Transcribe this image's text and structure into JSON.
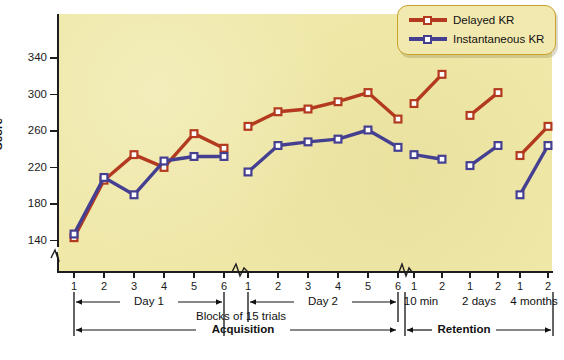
{
  "chart_data": {
    "type": "line",
    "title": "",
    "xlabel": "Blocks of 15 trials",
    "ylabel": "Score",
    "ylim": [
      120,
      352
    ],
    "yticks": [
      140,
      180,
      220,
      260,
      300,
      340
    ],
    "grid": false,
    "legend_position": "top-right",
    "x_tick_labels": [
      "1",
      "2",
      "3",
      "4",
      "5",
      "6",
      "1",
      "2",
      "3",
      "4",
      "5",
      "6",
      "1",
      "2",
      "1",
      "2",
      "1",
      "2"
    ],
    "x_group_labels": [
      "Day 1",
      "Day 2",
      "10 min",
      "2 days",
      "4 months"
    ],
    "phase_labels": [
      "Acquisition",
      "Retention"
    ],
    "series": [
      {
        "name": "Delayed KR",
        "color": "#b33a1e",
        "marker": "open-square",
        "segments": [
          {
            "group": "Day 1",
            "x": [
              "1",
              "2",
              "3",
              "4",
              "5",
              "6"
            ],
            "values": [
              142,
              205,
              233,
              219,
              256,
              240
            ]
          },
          {
            "group": "Day 2",
            "x": [
              "1",
              "2",
              "3",
              "4",
              "5",
              "6"
            ],
            "values": [
              264,
              280,
              283,
              291,
              301,
              272
            ]
          },
          {
            "group": "10 min",
            "x": [
              "1",
              "2"
            ],
            "values": [
              289,
              321
            ]
          },
          {
            "group": "2 days",
            "x": [
              "1",
              "2"
            ],
            "values": [
              276,
              301
            ]
          },
          {
            "group": "4 months",
            "x": [
              "1",
              "2"
            ],
            "values": [
              232,
              264
            ]
          }
        ]
      },
      {
        "name": "Instantaneous KR",
        "color": "#453f91",
        "marker": "open-square",
        "segments": [
          {
            "group": "Day 1",
            "x": [
              "1",
              "2",
              "3",
              "4",
              "5",
              "6"
            ],
            "values": [
              146,
              208,
              189,
              226,
              231,
              231
            ]
          },
          {
            "group": "Day 2",
            "x": [
              "1",
              "2",
              "3",
              "4",
              "5",
              "6"
            ],
            "values": [
              214,
              243,
              247,
              250,
              260,
              241
            ]
          },
          {
            "group": "10 min",
            "x": [
              "1",
              "2"
            ],
            "values": [
              233,
              228
            ]
          },
          {
            "group": "2 days",
            "x": [
              "1",
              "2"
            ],
            "values": [
              221,
              243
            ]
          },
          {
            "group": "4 months",
            "x": [
              "1",
              "2"
            ],
            "values": [
              189,
              243
            ]
          }
        ]
      }
    ]
  },
  "axis": {
    "y_title": "Score",
    "y_tick_labels": [
      "340",
      "300",
      "260",
      "220",
      "180",
      "140"
    ],
    "x_caption": "Blocks of 15 trials"
  },
  "legend": {
    "items": [
      {
        "label": "Delayed KR",
        "color": "#b33a1e"
      },
      {
        "label": "Instantaneous KR",
        "color": "#453f91"
      }
    ]
  },
  "brackets": {
    "day1": "Day 1",
    "day2": "Day 2",
    "ret1": "10 min",
    "ret2": "2 days",
    "ret3": "4 months",
    "acquisition": "Acquisition",
    "retention": "Retention"
  },
  "xticks": [
    {
      "label": "1",
      "x": 74
    },
    {
      "label": "2",
      "x": 104
    },
    {
      "label": "3",
      "x": 134
    },
    {
      "label": "4",
      "x": 164
    },
    {
      "label": "5",
      "x": 194
    },
    {
      "label": "6",
      "x": 224
    },
    {
      "label": "1",
      "x": 248
    },
    {
      "label": "2",
      "x": 278
    },
    {
      "label": "3",
      "x": 308
    },
    {
      "label": "4",
      "x": 338
    },
    {
      "label": "5",
      "x": 368
    },
    {
      "label": "6",
      "x": 398
    },
    {
      "label": "1",
      "x": 414
    },
    {
      "label": "2",
      "x": 442
    },
    {
      "label": "1",
      "x": 470
    },
    {
      "label": "2",
      "x": 498
    },
    {
      "label": "1",
      "x": 520
    },
    {
      "label": "2",
      "x": 548
    }
  ],
  "colors": {
    "plot_background": "#efe8a8",
    "delayed": "#b33a1e",
    "instantaneous": "#453f91",
    "axis": "#1d1d1d",
    "legend_border": "#c9a227",
    "legend_fill": "#f2e9b0"
  }
}
